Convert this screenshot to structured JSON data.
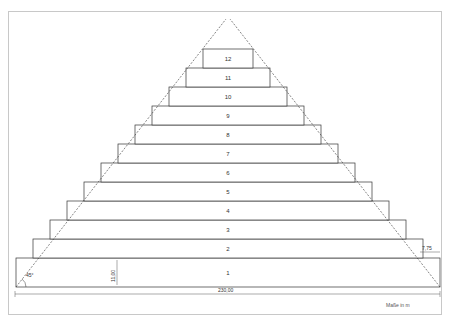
{
  "diagram": {
    "type": "stepped pyramid cross-section",
    "tiers": [
      {
        "n": 1,
        "label": "1"
      },
      {
        "n": 2,
        "label": "2"
      },
      {
        "n": 3,
        "label": "3"
      },
      {
        "n": 4,
        "label": "4"
      },
      {
        "n": 5,
        "label": "5"
      },
      {
        "n": 6,
        "label": "6"
      },
      {
        "n": 7,
        "label": "7"
      },
      {
        "n": 8,
        "label": "8"
      },
      {
        "n": 9,
        "label": "9"
      },
      {
        "n": 10,
        "label": "10"
      },
      {
        "n": 11,
        "label": "11"
      },
      {
        "n": 12,
        "label": "12"
      }
    ],
    "dimensions": {
      "base_width": "230,00",
      "tier_height": "11,00",
      "step_offset": "7,75",
      "angle": "45°"
    },
    "units_note": "Maße in m",
    "colors": {
      "fill_gray": "#b4b4b4",
      "line": "#333333",
      "frame": "#c8c8c8"
    }
  }
}
